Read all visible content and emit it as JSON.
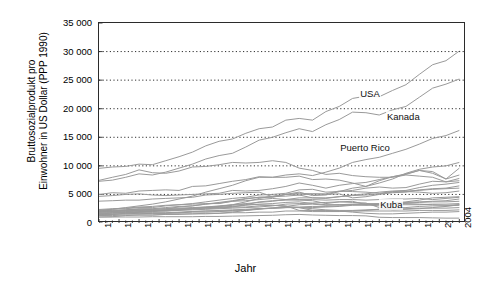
{
  "chart_data": {
    "type": "line",
    "title": "",
    "xlabel": "Jahr",
    "ylabel": "Bruttosozialprodukt pro Einwohner in US Dollar (PPP 1990)",
    "ylabel_line1": "Bruttosozialprodukt pro",
    "ylabel_line2": "Einwohner in US Dollar (PPP 1990)",
    "xlim": [
      1950,
      2005
    ],
    "ylim": [
      0,
      35000
    ],
    "yticks": [
      0,
      5000,
      10000,
      15000,
      20000,
      25000,
      30000,
      35000
    ],
    "ytick_labels": [
      "0",
      "5 000",
      "10 000",
      "15 000",
      "20 000",
      "25 000",
      "30 000",
      "35 000"
    ],
    "xticks": [
      1950,
      1953,
      1956,
      1959,
      1962,
      1965,
      1968,
      1971,
      1974,
      1977,
      1980,
      1983,
      1986,
      1989,
      1992,
      1995,
      1998,
      2001,
      2004
    ],
    "xtick_labels": [
      "1950",
      "1953",
      "1956",
      "1959",
      "1962",
      "1965",
      "1968",
      "1971",
      "1974",
      "1977",
      "1980",
      "1983",
      "1986",
      "1989",
      "1992",
      "1995",
      "1998",
      "2001",
      "2004"
    ],
    "grid": "horizontal-dotted",
    "legend": "none",
    "annotations": [
      {
        "text": "USA",
        "x": 1989,
        "y": 22600
      },
      {
        "text": "Kanada",
        "x": 1993,
        "y": 18600
      },
      {
        "text": "Puerto Rico",
        "x": 1986,
        "y": 13200
      },
      {
        "text": "Kuba",
        "x": 1992,
        "y": 3100
      }
    ],
    "line_color": "#9a9a9a",
    "axis_color": "#2b2b2b",
    "x": [
      1950,
      1952,
      1954,
      1956,
      1958,
      1960,
      1962,
      1964,
      1966,
      1968,
      1970,
      1972,
      1974,
      1976,
      1978,
      1980,
      1982,
      1984,
      1986,
      1988,
      1990,
      1992,
      1994,
      1996,
      1998,
      2000,
      2002,
      2004
    ],
    "series": [
      {
        "name": "USA",
        "values": [
          9561,
          9800,
          9900,
          10300,
          10200,
          10900,
          11600,
          12400,
          13500,
          14300,
          14700,
          15700,
          16500,
          16800,
          18000,
          18300,
          18000,
          19500,
          20400,
          21800,
          22200,
          22100,
          23200,
          24200,
          26000,
          27700,
          28400,
          30100
        ]
      },
      {
        "name": "Kanada",
        "values": [
          7300,
          7500,
          8000,
          8600,
          8400,
          8900,
          9600,
          10300,
          11200,
          11800,
          12200,
          13300,
          14500,
          15000,
          15800,
          16500,
          16000,
          17200,
          18100,
          19400,
          19300,
          18900,
          19800,
          20400,
          22000,
          23600,
          24300,
          25200
        ]
      },
      {
        "name": "Puerto Rico",
        "values": [
          2100,
          2400,
          2700,
          3000,
          3300,
          3700,
          4200,
          4700,
          5400,
          6000,
          6600,
          7400,
          8000,
          8000,
          8400,
          8600,
          8300,
          8900,
          9600,
          10600,
          11100,
          11500,
          12200,
          12900,
          13800,
          14800,
          15300,
          16200
        ]
      },
      {
        "name": "Argentinien",
        "values": [
          4987,
          5300,
          5200,
          5600,
          5700,
          5800,
          5700,
          6400,
          6500,
          6900,
          7300,
          7600,
          8100,
          8000,
          8000,
          8200,
          7600,
          7700,
          7500,
          7000,
          6400,
          7400,
          8100,
          8500,
          9200,
          9000,
          7700,
          9600
        ]
      },
      {
        "name": "Venezuela",
        "values": [
          7462,
          8000,
          8500,
          9300,
          8800,
          8700,
          9100,
          9800,
          9900,
          10200,
          10600,
          10500,
          10600,
          10900,
          10600,
          9600,
          9200,
          8500,
          8700,
          8300,
          8100,
          8000,
          8000,
          8400,
          8200,
          8000,
          7200,
          7800
        ]
      },
      {
        "name": "Chile",
        "values": [
          3821,
          3900,
          4000,
          4000,
          4200,
          4300,
          4400,
          4500,
          4900,
          5000,
          5200,
          5300,
          5400,
          4600,
          5000,
          5400,
          4800,
          4900,
          5500,
          6100,
          6400,
          7000,
          7700,
          8700,
          9400,
          9800,
          10000,
          10600
        ]
      },
      {
        "name": "Uruguay",
        "values": [
          4659,
          4800,
          5000,
          5100,
          4900,
          4800,
          4900,
          5000,
          5100,
          5200,
          5700,
          5600,
          5700,
          6000,
          6400,
          7000,
          6600,
          6100,
          6600,
          6900,
          7100,
          7600,
          8100,
          8600,
          9200,
          8700,
          7700,
          8400
        ]
      },
      {
        "name": "Mexiko",
        "values": [
          2365,
          2500,
          2600,
          2800,
          2900,
          3100,
          3200,
          3400,
          3700,
          4000,
          4300,
          4500,
          4900,
          5000,
          5200,
          5800,
          5900,
          5400,
          5500,
          5700,
          6100,
          6300,
          6100,
          6200,
          6800,
          7300,
          7200,
          7400
        ]
      },
      {
        "name": "Costa Rica",
        "values": [
          1963,
          2100,
          2300,
          2500,
          2500,
          2700,
          2900,
          3000,
          3300,
          3500,
          3800,
          4200,
          4500,
          4500,
          5000,
          4900,
          4400,
          4300,
          4600,
          4900,
          5100,
          5400,
          5600,
          5700,
          6200,
          6600,
          6800,
          7100
        ]
      },
      {
        "name": "Panama",
        "values": [
          1916,
          2000,
          2100,
          2200,
          2400,
          2500,
          2800,
          3000,
          3300,
          3600,
          3900,
          4300,
          4500,
          4600,
          4700,
          4900,
          5100,
          5000,
          5100,
          4400,
          4600,
          5000,
          5300,
          5400,
          5800,
          6000,
          6100,
          6500
        ]
      },
      {
        "name": "Brasilien",
        "values": [
          1672,
          1800,
          1900,
          2000,
          2100,
          2300,
          2500,
          2500,
          2600,
          2900,
          3200,
          3700,
          4300,
          4700,
          5000,
          5200,
          5100,
          5100,
          5600,
          5500,
          5400,
          5200,
          5500,
          5600,
          5700,
          5900,
          6000,
          6100
        ]
      },
      {
        "name": "Kolumbien",
        "values": [
          2153,
          2200,
          2300,
          2400,
          2400,
          2500,
          2600,
          2700,
          2800,
          3000,
          3200,
          3400,
          3600,
          3800,
          4100,
          4400,
          4400,
          4400,
          4600,
          4800,
          4900,
          5100,
          5400,
          5500,
          5400,
          5200,
          5300,
          5600
        ]
      },
      {
        "name": "Kuba",
        "values": [
          2046,
          2100,
          2200,
          2300,
          2200,
          2100,
          2200,
          2300,
          2400,
          2500,
          2600,
          2700,
          2800,
          3000,
          3300,
          3400,
          3500,
          3600,
          3700,
          3600,
          3500,
          2700,
          2300,
          2400,
          2500,
          2700,
          2900,
          3200
        ]
      },
      {
        "name": "Peru",
        "values": [
          2263,
          2400,
          2500,
          2700,
          2700,
          3000,
          3200,
          3300,
          3400,
          3400,
          3800,
          3900,
          4100,
          4300,
          4100,
          4000,
          3900,
          3400,
          3700,
          3800,
          3200,
          3000,
          3300,
          3600,
          3700,
          3800,
          3900,
          4200
        ]
      },
      {
        "name": "Ecuador",
        "values": [
          1863,
          1900,
          2000,
          2100,
          2100,
          2200,
          2300,
          2400,
          2500,
          2600,
          2800,
          3200,
          3700,
          3900,
          4000,
          4100,
          4100,
          4000,
          4100,
          4100,
          4000,
          4100,
          4200,
          4200,
          4300,
          4100,
          4300,
          4500
        ]
      },
      {
        "name": "Dominikanische Republik",
        "values": [
          1045,
          1100,
          1300,
          1400,
          1400,
          1500,
          1600,
          1600,
          1600,
          1700,
          1900,
          2200,
          2500,
          2600,
          2700,
          2800,
          2900,
          2900,
          3000,
          3200,
          3100,
          3300,
          3500,
          3700,
          4000,
          4400,
          4500,
          4600
        ]
      },
      {
        "name": "Guatemala",
        "values": [
          2085,
          2100,
          2100,
          2200,
          2300,
          2300,
          2400,
          2600,
          2700,
          2800,
          2900,
          3100,
          3300,
          3400,
          3600,
          3700,
          3400,
          3200,
          3200,
          3200,
          3200,
          3300,
          3400,
          3500,
          3600,
          3700,
          3700,
          3800
        ]
      },
      {
        "name": "El Salvador",
        "values": [
          1489,
          1500,
          1600,
          1700,
          1700,
          1700,
          1800,
          2000,
          2100,
          2100,
          2200,
          2300,
          2500,
          2600,
          2700,
          2700,
          2200,
          2100,
          2100,
          2100,
          2200,
          2400,
          2600,
          2700,
          2900,
          3000,
          3000,
          3100
        ]
      },
      {
        "name": "Paraguay",
        "values": [
          1584,
          1600,
          1600,
          1600,
          1700,
          1700,
          1800,
          1900,
          1900,
          2000,
          2100,
          2200,
          2400,
          2600,
          2900,
          3200,
          3300,
          3100,
          3200,
          3300,
          3400,
          3400,
          3400,
          3400,
          3300,
          3200,
          3100,
          3200
        ]
      },
      {
        "name": "Jamaika",
        "values": [
          1327,
          1500,
          1700,
          1900,
          2100,
          2300,
          2400,
          2600,
          2800,
          2900,
          3100,
          3300,
          3200,
          3100,
          2900,
          2700,
          2700,
          2800,
          2900,
          3100,
          3200,
          3200,
          3200,
          3200,
          3200,
          3300,
          3300,
          3400
        ]
      },
      {
        "name": "Bolivien",
        "values": [
          1919,
          1900,
          1800,
          1800,
          1800,
          1800,
          1900,
          2000,
          2100,
          2200,
          2300,
          2400,
          2500,
          2600,
          2700,
          2700,
          2500,
          2300,
          2200,
          2200,
          2300,
          2400,
          2400,
          2500,
          2600,
          2600,
          2600,
          2700
        ]
      },
      {
        "name": "Nicaragua",
        "values": [
          1616,
          1700,
          1800,
          1900,
          2000,
          2100,
          2300,
          2500,
          2700,
          2700,
          2800,
          2800,
          3000,
          3100,
          3000,
          2200,
          2200,
          2200,
          2100,
          1900,
          1700,
          1600,
          1600,
          1700,
          1800,
          1900,
          1900,
          2000
        ]
      },
      {
        "name": "Honduras",
        "values": [
          1313,
          1300,
          1400,
          1400,
          1400,
          1500,
          1500,
          1600,
          1700,
          1700,
          1800,
          1800,
          1900,
          1900,
          2100,
          2100,
          2000,
          2000,
          2000,
          2100,
          2100,
          2100,
          2100,
          2100,
          2200,
          2200,
          2200,
          2300
        ]
      },
      {
        "name": "Haiti",
        "values": [
          1051,
          1050,
          1050,
          1050,
          1100,
          1100,
          1100,
          1100,
          1150,
          1150,
          1200,
          1250,
          1300,
          1350,
          1450,
          1500,
          1400,
          1350,
          1300,
          1300,
          1250,
          1000,
          950,
          950,
          950,
          900,
          850,
          850
        ]
      }
    ]
  },
  "annotations_labels": {
    "usa": "USA",
    "kanada": "Kanada",
    "puerto_rico": "Puerto Rico",
    "kuba": "Kuba"
  }
}
